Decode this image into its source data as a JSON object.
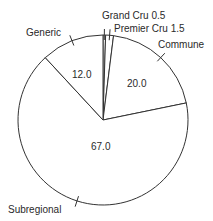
{
  "chart_data": {
    "type": "pie",
    "title": "",
    "start_angle_deg": 90,
    "direction": "clockwise",
    "categories": [
      "Grand Cru",
      "Premier Cru",
      "Commune",
      "Subregional",
      "Generic"
    ],
    "values": [
      0.5,
      1.5,
      20.0,
      67.0,
      12.0
    ],
    "labels": [
      "Grand Cru 0.5",
      "Premier Cru 1.5",
      "Commune",
      "Subregional",
      "Generic"
    ],
    "value_labels": [
      "",
      "",
      "20.0",
      "67.0",
      "12.0"
    ],
    "fill_color": "#ffffff",
    "edge_color": "#333333",
    "legend": "none"
  }
}
